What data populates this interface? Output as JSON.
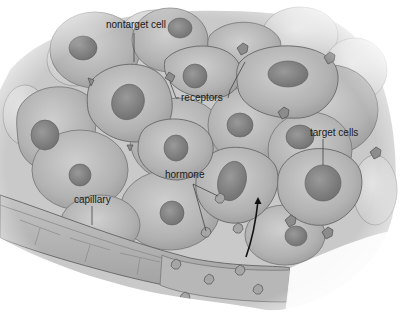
{
  "diagram": {
    "labels": {
      "nontarget_cell": "nontarget cell",
      "receptors": "receptors",
      "target_cells": "target cells",
      "hormone": "hormone",
      "capillary": "capillary"
    },
    "colors": {
      "cell_fill": "#b4b4b4",
      "cell_edge": "#7a7a7a",
      "nucleus": "#8a8a8a",
      "capillary": "#a9a9a9",
      "arrow": "#111111",
      "background": "#ffffff"
    }
  }
}
